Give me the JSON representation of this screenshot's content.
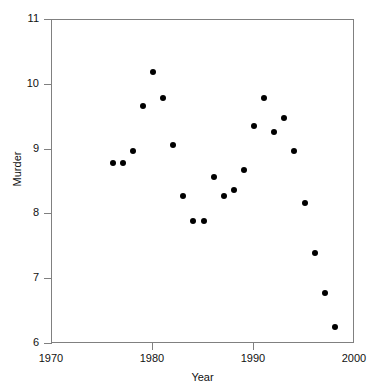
{
  "chart_data": {
    "type": "scatter",
    "title": "",
    "xlabel": "Year",
    "ylabel": "Murder",
    "xlim": [
      1970,
      2000
    ],
    "ylim": [
      6,
      11
    ],
    "xticks": [
      1970,
      1980,
      1990,
      2000
    ],
    "yticks": [
      6,
      7,
      8,
      9,
      10,
      11
    ],
    "xtick_labels": [
      "1970",
      "1980",
      "1990",
      "2000"
    ],
    "ytick_labels": [
      "6",
      "7",
      "8",
      "9",
      "10",
      "11"
    ],
    "grid": false,
    "legend": false,
    "marker": "filled-circle",
    "marker_color": "#000000",
    "frame_color": "#808080",
    "background": "#ffffff",
    "x": [
      1976,
      1977,
      1978,
      1979,
      1980,
      1981,
      1982,
      1983,
      1984,
      1985,
      1986,
      1987,
      1988,
      1989,
      1990,
      1991,
      1992,
      1993,
      1994,
      1995,
      1996,
      1997,
      1998
    ],
    "y": [
      8.8,
      8.8,
      8.98,
      9.68,
      10.2,
      9.79,
      9.07,
      8.28,
      7.9,
      7.9,
      8.58,
      8.28,
      8.37,
      8.68,
      9.37,
      9.79,
      9.27,
      9.48,
      8.98,
      8.18,
      7.4,
      6.78,
      6.26
    ],
    "points": [
      {
        "year": 1976,
        "murder": 8.8
      },
      {
        "year": 1977,
        "murder": 8.8
      },
      {
        "year": 1978,
        "murder": 8.98
      },
      {
        "year": 1979,
        "murder": 9.68
      },
      {
        "year": 1980,
        "murder": 10.2
      },
      {
        "year": 1981,
        "murder": 9.79
      },
      {
        "year": 1982,
        "murder": 9.07
      },
      {
        "year": 1983,
        "murder": 8.28
      },
      {
        "year": 1984,
        "murder": 7.9
      },
      {
        "year": 1985,
        "murder": 7.9
      },
      {
        "year": 1986,
        "murder": 8.58
      },
      {
        "year": 1987,
        "murder": 8.28
      },
      {
        "year": 1988,
        "murder": 8.37
      },
      {
        "year": 1989,
        "murder": 8.68
      },
      {
        "year": 1990,
        "murder": 9.37
      },
      {
        "year": 1991,
        "murder": 9.79
      },
      {
        "year": 1992,
        "murder": 9.27
      },
      {
        "year": 1993,
        "murder": 9.48
      },
      {
        "year": 1994,
        "murder": 8.98
      },
      {
        "year": 1995,
        "murder": 8.18
      },
      {
        "year": 1996,
        "murder": 7.4
      },
      {
        "year": 1997,
        "murder": 6.78
      },
      {
        "year": 1998,
        "murder": 6.26
      }
    ]
  }
}
